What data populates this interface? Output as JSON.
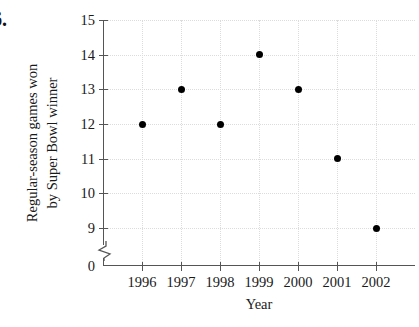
{
  "exercise_label": "6.",
  "axes": {
    "y_title_line1": "Regular-season games won",
    "y_title_line2": "by Super Bowl winner",
    "x_title": "Year",
    "y_tick_labels": [
      "15",
      "14",
      "13",
      "12",
      "11",
      "10",
      "9",
      "0"
    ],
    "x_tick_labels": [
      "1996",
      "1997",
      "1998",
      "1999",
      "2000",
      "2001",
      "2002"
    ]
  },
  "chart_data": {
    "type": "scatter",
    "title": "",
    "xlabel": "Year",
    "ylabel": "Regular-season games won by Super Bowl winner",
    "categories": [
      "1996",
      "1997",
      "1998",
      "1999",
      "2000",
      "2001",
      "2002"
    ],
    "x": [
      1996,
      1997,
      1998,
      1999,
      2000,
      2001,
      2002
    ],
    "values": [
      12,
      13,
      12,
      14,
      13,
      11,
      9
    ],
    "points": [
      {
        "x": "1996",
        "y": 12
      },
      {
        "x": "1997",
        "y": 13
      },
      {
        "x": "1998",
        "y": 12
      },
      {
        "x": "1999",
        "y": 14
      },
      {
        "x": "2000",
        "y": 13
      },
      {
        "x": "2001",
        "y": 11
      },
      {
        "x": "2002",
        "y": 9
      }
    ],
    "xlim": [
      1995.3,
      2002.6
    ],
    "ylim": [
      9,
      15
    ],
    "y_axis_break": true,
    "y_break_between": [
      0,
      9
    ],
    "y_ticks": [
      9,
      10,
      11,
      12,
      13,
      14,
      15
    ],
    "y_extra_tick": 0,
    "grid": true,
    "grid_style": "dotted",
    "grid_color": "#dcdcdc",
    "marker_color": "#000000",
    "marker_shape": "circle",
    "legend": false,
    "legend_position": "none"
  }
}
